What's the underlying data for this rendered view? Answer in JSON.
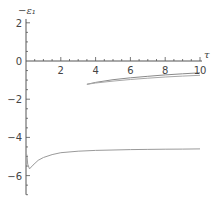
{
  "chart_data": {
    "type": "line",
    "title": "",
    "xlabel": "τ",
    "ylabel": "-ε₁",
    "xlim": [
      0,
      10
    ],
    "ylim": [
      -7,
      2.2
    ],
    "grid": false,
    "legend": null,
    "x_ticks": [
      2,
      4,
      6,
      8,
      10
    ],
    "y_ticks": [
      2,
      0,
      -2,
      -4,
      -6
    ],
    "x_tick_labels": [
      "2",
      "4",
      "6",
      "8",
      "10"
    ],
    "y_tick_labels": [
      "2",
      "0",
      "-2",
      "-4",
      "-6"
    ],
    "series": [
      {
        "name": "lower branch",
        "x": [
          0.05,
          0.1,
          0.2,
          0.4,
          0.7,
          1.0,
          1.5,
          2,
          3,
          4,
          5,
          6,
          7,
          8,
          9,
          10
        ],
        "y": [
          -4.9,
          -5.4,
          -5.65,
          -5.45,
          -5.2,
          -5.05,
          -4.9,
          -4.8,
          -4.72,
          -4.68,
          -4.66,
          -4.64,
          -4.63,
          -4.62,
          -4.61,
          -4.6
        ]
      },
      {
        "name": "upper branch a",
        "x": [
          3.5,
          4,
          5,
          6,
          7,
          8,
          9,
          10
        ],
        "y": [
          -1.22,
          -1.12,
          -0.98,
          -0.88,
          -0.8,
          -0.73,
          -0.67,
          -0.62
        ]
      },
      {
        "name": "upper branch b",
        "x": [
          3.5,
          4,
          5,
          6,
          7,
          8,
          9,
          10
        ],
        "y": [
          -1.22,
          -1.15,
          -1.05,
          -0.97,
          -0.9,
          -0.84,
          -0.79,
          -0.75
        ]
      }
    ]
  }
}
